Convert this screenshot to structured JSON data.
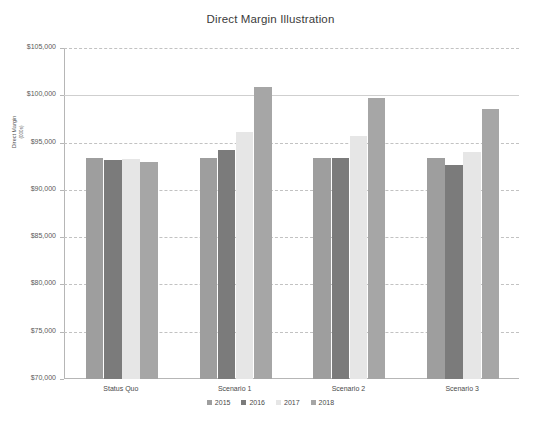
{
  "chart_data": {
    "type": "bar",
    "title": "Direct Margin Illustration",
    "xlabel": "",
    "ylabel": "Direct Margin",
    "ylabel_sub": "(000s)",
    "categories": [
      "Status Quo",
      "Scenario 1",
      "Scenario 2",
      "Scenario 3"
    ],
    "series": [
      {
        "name": "2015",
        "color": "#9e9e9e",
        "values": [
          93400,
          93400,
          93400,
          93400
        ]
      },
      {
        "name": "2016",
        "color": "#7b7b7b",
        "values": [
          93200,
          94200,
          93400,
          92600
        ]
      },
      {
        "name": "2017",
        "color": "#e6e6e6",
        "values": [
          93300,
          96100,
          95700,
          94000
        ]
      },
      {
        "name": "2018",
        "color": "#a6a6a6",
        "values": [
          92900,
          100900,
          99700,
          98500
        ]
      }
    ],
    "ylim": [
      70000,
      105000
    ],
    "ytick_values": [
      105000,
      100000,
      95000,
      90000,
      85000,
      80000,
      75000,
      70000
    ],
    "ytick_labels": [
      "$105,000",
      "$100,000",
      "$95,000",
      "$90,000",
      "$85,000",
      "$80,000",
      "$75,000",
      "$70,000"
    ],
    "grid": true,
    "legend_position": "bottom"
  }
}
